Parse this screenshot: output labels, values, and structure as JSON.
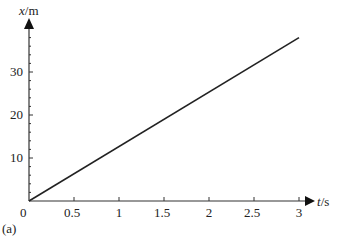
{
  "chart_data": {
    "type": "line",
    "title": "",
    "xlabel": "t/s",
    "ylabel": "x/m",
    "x_ticks": [
      "0",
      "0.5",
      "1",
      "1.5",
      "2",
      "2.5",
      "3"
    ],
    "y_ticks": [
      "10",
      "20",
      "30"
    ],
    "xlim": [
      0,
      3
    ],
    "ylim": [
      0,
      40
    ],
    "grid": false,
    "series": [
      {
        "name": "x(t)",
        "x": [
          0,
          3
        ],
        "y": [
          0,
          38
        ]
      }
    ],
    "annotations": [
      "(a)"
    ]
  },
  "labels": {
    "xlabel_t": "t",
    "xlabel_unit": "/s",
    "ylabel_x": "x",
    "ylabel_unit": "/m",
    "origin": "0",
    "panel": "(a)"
  }
}
